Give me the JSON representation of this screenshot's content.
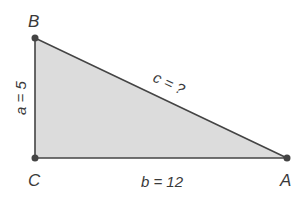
{
  "figure": {
    "type": "right-triangle",
    "fill_color": "#dcdcdc",
    "stroke_color": "#444444",
    "vertices": {
      "B": {
        "label": "B"
      },
      "C": {
        "label": "C"
      },
      "A": {
        "label": "A"
      }
    },
    "sides": {
      "a": {
        "label": "a = 5"
      },
      "b": {
        "label": "b = 12"
      },
      "c": {
        "label": "c = ?"
      }
    }
  }
}
